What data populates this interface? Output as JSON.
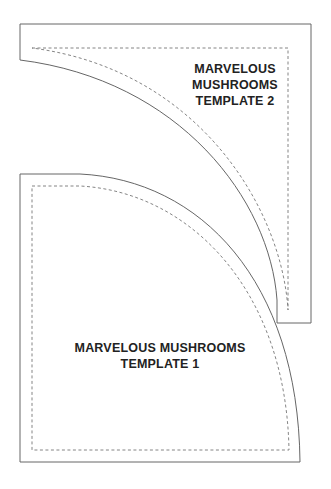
{
  "templates": [
    {
      "id": 2,
      "line1": "MARVELOUS",
      "line2": "MUSHROOMS",
      "line3": "TEMPLATE 2"
    },
    {
      "id": 1,
      "line1": "MARVELOUS MUSHROOMS",
      "line2": "TEMPLATE 1"
    }
  ],
  "colors": {
    "stroke": "#666666",
    "dash": "#777777",
    "text": "#222222"
  }
}
